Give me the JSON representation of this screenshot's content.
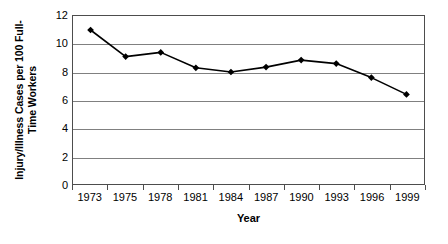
{
  "chart_data": {
    "type": "line",
    "title": "",
    "xlabel": "Year",
    "ylabel": "Injury/Illness Cases per 100 Full-Time Workers",
    "ylabel_line1": "Injury/Illness Cases per 100 Full-",
    "ylabel_line2": "Time Workers",
    "categories": [
      "1973",
      "1975",
      "1978",
      "1981",
      "1984",
      "1987",
      "1990",
      "1993",
      "1996",
      "1999"
    ],
    "x": [
      "1973",
      "1975",
      "1978",
      "1981",
      "1984",
      "1987",
      "1990",
      "1993",
      "1996",
      "1999"
    ],
    "values": [
      11.0,
      9.1,
      9.4,
      8.3,
      8.0,
      8.35,
      8.85,
      8.6,
      7.6,
      6.4
    ],
    "series": [
      {
        "name": "Injury/Illness Cases per 100 Full-Time Workers",
        "values": [
          11.0,
          9.1,
          9.4,
          8.3,
          8.0,
          8.35,
          8.85,
          8.6,
          7.6,
          6.4
        ]
      }
    ],
    "ylim": [
      0,
      12
    ],
    "ytick_values": [
      12,
      10,
      8,
      6,
      4,
      2,
      0
    ],
    "ytick_labels": [
      "12",
      "10",
      "8",
      "6",
      "4",
      "2",
      "0"
    ],
    "grid": true,
    "grid_axis": "y",
    "legend": false,
    "legend_position": "none",
    "marker": "diamond",
    "line_color": "#000000",
    "marker_color": "#000000",
    "grid_color": "#808080",
    "axis_color": "#4d4d4d",
    "background_color": "#ffffff"
  }
}
